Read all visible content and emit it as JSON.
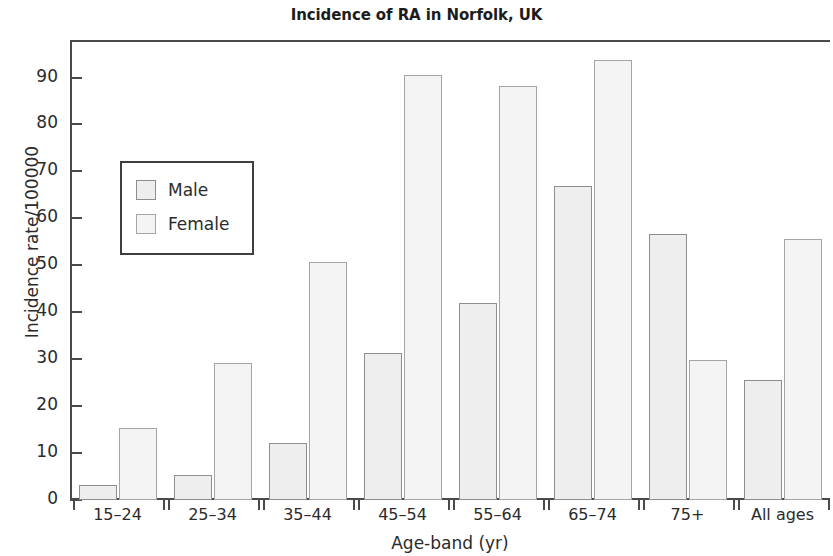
{
  "chart_data": {
    "type": "bar",
    "title": "Incidence of RA in Norfolk, UK",
    "xlabel": "Age-band (yr)",
    "ylabel": "Incidence rate/100000",
    "categories": [
      "15–24",
      "25–34",
      "35–44",
      "45–54",
      "55–64",
      "65–74",
      "75+",
      "All ages"
    ],
    "series": [
      {
        "name": "Male",
        "values": [
          3.2,
          5.3,
          12.1,
          31.4,
          42.0,
          67.0,
          56.6,
          25.5
        ],
        "color": "#eeeeee"
      },
      {
        "name": "Female",
        "values": [
          15.4,
          29.2,
          50.7,
          90.6,
          88.1,
          93.7,
          29.8,
          55.5
        ],
        "color": "#f4f4f4"
      }
    ],
    "ylim": [
      0,
      98
    ],
    "yticks": [
      0,
      10,
      20,
      30,
      40,
      50,
      60,
      70,
      80,
      90
    ],
    "ytick_labels": [
      "0",
      "10",
      "20",
      "30",
      "40",
      "50",
      "60",
      "70",
      "80",
      "90"
    ],
    "grid": false,
    "legend_position": "upper left",
    "legend_entries": [
      "Male",
      "Female"
    ]
  }
}
